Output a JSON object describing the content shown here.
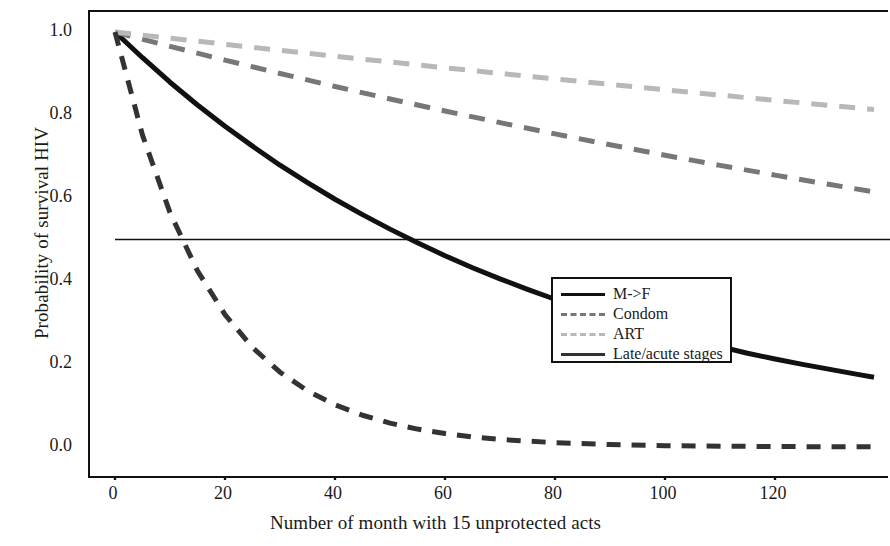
{
  "chart_data": {
    "type": "line",
    "title": "",
    "xlabel": "Number of month with 15 unprotected acts",
    "ylabel": "Probability of survival HIV",
    "xlim": [
      0,
      138
    ],
    "ylim": [
      0.0,
      1.06
    ],
    "xticks": [
      0,
      20,
      40,
      60,
      80,
      100,
      120
    ],
    "xtick_labels": [
      "0",
      "20",
      "40",
      "60",
      "80",
      "100",
      "120"
    ],
    "yticks": [
      0.0,
      0.2,
      0.4,
      0.6,
      0.8,
      1.0
    ],
    "ytick_labels": [
      "0.0",
      "0.2",
      "0.4",
      "0.6",
      "0.8",
      "1.0"
    ],
    "grid": false,
    "legend_position": "center-right",
    "reference_line": {
      "name": "half-survival",
      "y": 0.5,
      "style": "solid",
      "color": "#111111",
      "width": 1.4
    },
    "series": [
      {
        "name": "M->F",
        "style": "solid",
        "color": "#111111",
        "width": 5,
        "x": [
          0,
          5,
          10,
          15,
          20,
          25,
          30,
          35,
          40,
          45,
          50,
          55,
          60,
          65,
          70,
          75,
          80,
          85,
          90,
          95,
          100,
          105,
          110,
          115,
          120,
          125,
          130,
          135,
          138
        ],
        "y": [
          1.0,
          0.938,
          0.879,
          0.824,
          0.773,
          0.725,
          0.679,
          0.637,
          0.597,
          0.56,
          0.525,
          0.492,
          0.461,
          0.432,
          0.405,
          0.38,
          0.356,
          0.334,
          0.313,
          0.293,
          0.275,
          0.258,
          0.242,
          0.226,
          0.212,
          0.199,
          0.187,
          0.175,
          0.168
        ]
      },
      {
        "name": "Condom",
        "style": "dashed",
        "color": "#777777",
        "width": 5,
        "x": [
          0,
          10,
          20,
          30,
          40,
          50,
          60,
          70,
          80,
          90,
          100,
          110,
          120,
          130,
          138
        ],
        "y": [
          1.0,
          0.9655,
          0.9322,
          0.9,
          0.8688,
          0.8387,
          0.8097,
          0.7816,
          0.7545,
          0.7283,
          0.703,
          0.6787,
          0.6551,
          0.6324,
          0.6147
        ]
      },
      {
        "name": "ART",
        "style": "dashed",
        "color": "#b8b8b8",
        "width": 5,
        "x": [
          0,
          10,
          20,
          30,
          40,
          50,
          60,
          70,
          80,
          90,
          100,
          110,
          120,
          130,
          138
        ],
        "y": [
          1.0,
          0.9851,
          0.9704,
          0.956,
          0.9417,
          0.9277,
          0.9139,
          0.9003,
          0.8869,
          0.8737,
          0.8607,
          0.8479,
          0.8353,
          0.8229,
          0.8131
        ]
      },
      {
        "name": "Late/acute stages",
        "style": "dashed",
        "color": "#333333",
        "width": 5,
        "x": [
          0,
          5,
          10,
          15,
          20,
          25,
          30,
          35,
          40,
          45,
          50,
          55,
          60,
          65,
          70,
          80,
          90,
          100,
          110,
          120,
          130,
          138
        ],
        "y": [
          1.0,
          0.7515,
          0.5647,
          0.4244,
          0.319,
          0.2397,
          0.1802,
          0.1354,
          0.1017,
          0.0765,
          0.0575,
          0.0432,
          0.0325,
          0.0244,
          0.0183,
          0.0104,
          0.0059,
          0.0033,
          0.0019,
          0.0011,
          0.0006,
          0.0004
        ]
      }
    ]
  },
  "legend": {
    "items": [
      {
        "label": "M->F",
        "style": "solid",
        "color": "#111111"
      },
      {
        "label": "Condom",
        "style": "dashed",
        "color": "#777777"
      },
      {
        "label": "ART",
        "style": "dashed",
        "color": "#b8b8b8"
      },
      {
        "label": "Late/acute stages",
        "style": "solid",
        "color": "#333333"
      }
    ]
  }
}
